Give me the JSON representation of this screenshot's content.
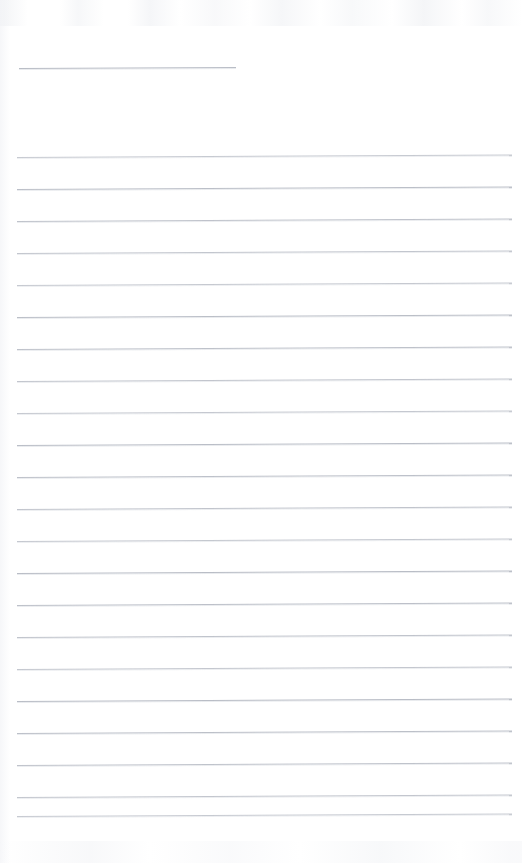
{
  "document": {
    "kind": "scanned-ruled-notebook-page",
    "page_width": 522,
    "page_height": 863,
    "page_background_color": "#ffffff",
    "rule_color": "#b9bdc6",
    "rule_thickness_px": 1,
    "visible_text": "",
    "header_rule": {
      "label": "header-entry-rule",
      "x_start": 19,
      "x_end": 236,
      "y": 68,
      "length": 217,
      "skew_deg": -0.25
    },
    "body_rules": {
      "count": 22,
      "x_start": 17,
      "x_end": 512,
      "first_y": 157,
      "spacing": 32,
      "skew_deg": -0.28,
      "y_positions": [
        157,
        189,
        221,
        253,
        285,
        317,
        349,
        381,
        413,
        445,
        477,
        509,
        541,
        573,
        605,
        637,
        669,
        701,
        733,
        765,
        797,
        816
      ]
    },
    "margins": {
      "left": 17,
      "right": 10,
      "top": 68,
      "bottom": 47
    }
  }
}
